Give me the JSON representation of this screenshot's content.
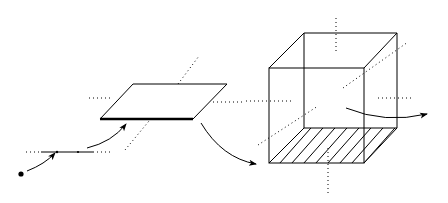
{
  "diagram": {
    "stroke_color": "#000000",
    "background_color": "#ffffff",
    "elements": [
      {
        "name": "point",
        "shape": "dot",
        "x": 21,
        "y": 174
      },
      {
        "name": "line-segment",
        "shape": "line",
        "x1": 41,
        "y1": 152,
        "x2": 93,
        "y2": 152
      },
      {
        "name": "plane",
        "shape": "parallelogram"
      },
      {
        "name": "cube",
        "shape": "cube",
        "hatched_face": "bottom"
      }
    ],
    "arrows": [
      {
        "name": "point-to-line-arrow"
      },
      {
        "name": "line-to-plane-arrow"
      },
      {
        "name": "plane-to-cube-arrow"
      },
      {
        "name": "cube-out-arrow"
      }
    ],
    "text_labels": []
  }
}
